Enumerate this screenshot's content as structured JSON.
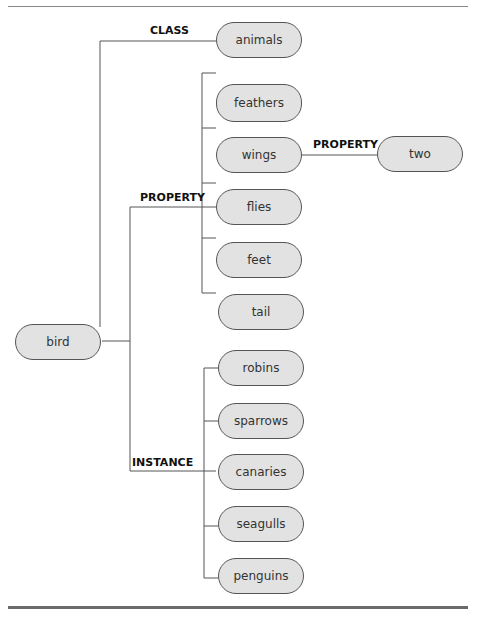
{
  "diagram": {
    "type": "semantic-network",
    "root": "bird",
    "nodes": {
      "bird": "bird",
      "animals": "animals",
      "feathers": "feathers",
      "wings": "wings",
      "flies": "flies",
      "feet": "feet",
      "tail": "tail",
      "two": "two",
      "robins": "robins",
      "sparrows": "sparrows",
      "canaries": "canaries",
      "seagulls": "seagulls",
      "penguins": "penguins"
    },
    "edge_labels": {
      "class": "CLASS",
      "property": "PROPERTY",
      "wings_property": "PROPERTY",
      "instance": "INSTANCE"
    },
    "relations": [
      {
        "from": "bird",
        "label": "CLASS",
        "to": [
          "animals"
        ]
      },
      {
        "from": "bird",
        "label": "PROPERTY",
        "to": [
          "feathers",
          "wings",
          "flies",
          "feet",
          "tail"
        ]
      },
      {
        "from": "wings",
        "label": "PROPERTY",
        "to": [
          "two"
        ]
      },
      {
        "from": "bird",
        "label": "INSTANCE",
        "to": [
          "robins",
          "sparrows",
          "canaries",
          "seagulls",
          "penguins"
        ]
      }
    ]
  }
}
